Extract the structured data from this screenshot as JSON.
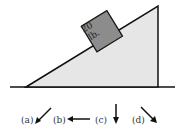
{
  "diagram": {
    "block": {
      "line1": "20",
      "line2": "lb."
    },
    "options": [
      {
        "label": "(a)",
        "direction": "down-left"
      },
      {
        "label": "(b)",
        "direction": "left"
      },
      {
        "label": "(c)",
        "direction": "down"
      },
      {
        "label": "(d)",
        "direction": "down-right"
      }
    ],
    "colors": {
      "incline_fill": "#e6e6e6",
      "block_fill": "#8c8c8c",
      "stroke": "#111111"
    }
  }
}
